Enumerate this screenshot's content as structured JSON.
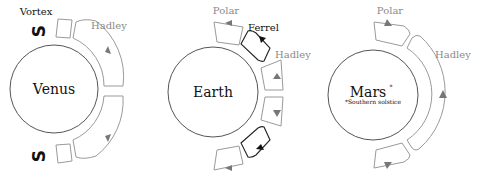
{
  "diagram": {
    "colors": {
      "planet_outline": "#555555",
      "hadley_polar_cell": "#9a9a9a",
      "ferrel_cell": "#222222",
      "gray_label": "#8a8a8a",
      "dark_label": "#111111"
    },
    "panels": [
      {
        "planet": "Venus",
        "cells": [
          "Vortex",
          "Hadley"
        ],
        "labels": {
          "vortex": "Vortex",
          "hadley": "Hadley",
          "vortex_symbol": "S"
        }
      },
      {
        "planet": "Earth",
        "cells": [
          "Polar",
          "Ferrel",
          "Hadley"
        ],
        "labels": {
          "polar": "Polar",
          "ferrel": "Ferrel",
          "hadley": "Hadley"
        }
      },
      {
        "planet": "Mars",
        "planet_marker": "*",
        "note": "*Southern solstice",
        "cells": [
          "Polar",
          "Hadley"
        ],
        "labels": {
          "polar": "Polar",
          "hadley": "Hadley"
        }
      }
    ]
  }
}
